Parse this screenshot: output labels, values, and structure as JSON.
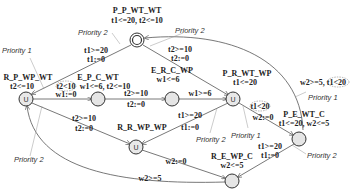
{
  "diagram": {
    "type": "timed-automaton",
    "nodes": [
      {
        "id": "P_P_WT_WT",
        "name": "P_P_WT_WT",
        "invariant": "t1<=20, t2<=10",
        "style": "initial",
        "x": 137,
        "y": 40
      },
      {
        "id": "R_P_WP_WT",
        "name": "R_P_WP_WT",
        "invariant": "t2<=10",
        "style": "urgent",
        "x": 26,
        "y": 99
      },
      {
        "id": "E_P_C_WT",
        "name": "E_P_C_WT",
        "invariant": "w1<=6, t2<=10",
        "style": "normal",
        "x": 98,
        "y": 99
      },
      {
        "id": "E_R_C_WP",
        "name": "E_R_C_WP",
        "invariant": "w1<=6",
        "style": "normal",
        "x": 172,
        "y": 99
      },
      {
        "id": "P_R_WT_WP",
        "name": "P_R_WT_WP",
        "invariant": "t1<=20",
        "style": "urgent",
        "x": 233,
        "y": 99
      },
      {
        "id": "R_R_WP_WP",
        "name": "R_R_WP_WP",
        "invariant": "",
        "style": "urgent",
        "x": 136,
        "y": 147
      },
      {
        "id": "P_E_WT_C",
        "name": "P_E_WT_C",
        "invariant": "t1<=20, w2<=5",
        "style": "normal",
        "x": 299,
        "y": 139
      },
      {
        "id": "R_E_WP_C",
        "name": "R_E_WP_C",
        "invariant": "w2<=5",
        "style": "normal",
        "x": 232,
        "y": 181
      }
    ],
    "edges": [
      {
        "from": "P_P_WT_WT",
        "to": "R_P_WP_WT",
        "guard": "t1>=20",
        "update": "t1:=0"
      },
      {
        "from": "P_E_WT_C",
        "to": "P_P_WT_WT",
        "guard": "t2>=10",
        "update": "t2:=0"
      },
      {
        "from": "P_P_WT_WT",
        "to": "P_R_WT_WP",
        "guard": "t2>=10",
        "update": "t2:=0"
      },
      {
        "from": "R_P_WP_WT",
        "to": "E_P_C_WT",
        "guard": "t2<10",
        "update": "w1:=0"
      },
      {
        "from": "E_P_C_WT",
        "to": "E_R_C_WP",
        "guard": "t2>=10",
        "update": "t2:=0"
      },
      {
        "from": "E_R_C_WP",
        "to": "P_R_WT_WP",
        "guard": "w1>=6",
        "update": ""
      },
      {
        "from": "R_P_WP_WT",
        "to": "R_R_WP_WP",
        "guard": "t2>=10",
        "update": "t2:=0"
      },
      {
        "from": "P_R_WT_WP",
        "to": "R_R_WP_WP",
        "guard": "t1>=20",
        "update": "t1:=0"
      },
      {
        "from": "P_R_WT_WP",
        "to": "P_E_WT_C",
        "guard": "t1<20",
        "update": "w2:=0"
      },
      {
        "from": "R_R_WP_WP",
        "to": "R_E_WP_C",
        "guard": "",
        "update": "w2:=0"
      },
      {
        "from": "P_E_WT_C",
        "to": "R_E_WP_C",
        "guard": "t1>=20",
        "update": "t1:=0"
      },
      {
        "from": "R_E_WP_C",
        "to": "R_P_WP_WT",
        "guard": "w2>=5",
        "update": ""
      },
      {
        "from": "P_E_WT_C",
        "to": "P_R_WT_WP",
        "guard": "w2>=5, t1<20",
        "update": ""
      }
    ],
    "priority_labels": [
      {
        "text": "Priority 2",
        "x": 84,
        "y": 31
      },
      {
        "text": "Priority 1",
        "x": 4,
        "y": 53
      },
      {
        "text": "Priority 2",
        "x": 175,
        "y": 31
      },
      {
        "text": "Priority 2",
        "x": 14,
        "y": 162
      },
      {
        "text": "Priority 1",
        "x": 308,
        "y": 92
      },
      {
        "text": "Priority 2",
        "x": 196,
        "y": 139
      },
      {
        "text": "Priority 1",
        "x": 233,
        "y": 135
      },
      {
        "text": "Priority 2",
        "x": 307,
        "y": 156
      }
    ]
  }
}
